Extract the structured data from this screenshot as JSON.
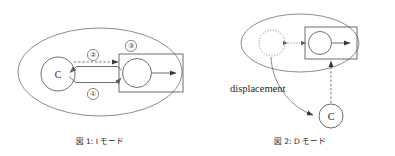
{
  "page": {
    "background_color": "#ffffff",
    "ink_color": "#1f1f1f",
    "width": 395,
    "height": 156
  },
  "figures": [
    {
      "id": "figure-1",
      "caption": "図 1: I モード",
      "caption_number": "図 1:",
      "caption_title": "I モード",
      "outer_shape": "ellipse",
      "nodes": [
        {
          "name": "controller-circle",
          "label": "C",
          "shape": "circle",
          "style": "solid"
        },
        {
          "name": "plant-circle",
          "label": "",
          "shape": "circle",
          "style": "solid"
        },
        {
          "name": "plant-box",
          "label": "",
          "shape": "rectangle",
          "style": "solid"
        }
      ],
      "edge_labels": [
        "①",
        "②",
        "③"
      ],
      "edges": [
        {
          "name": "edge-2-dashed",
          "label": "②",
          "style": "dashed",
          "direction": "right"
        },
        {
          "name": "edge-feedback",
          "label": "",
          "style": "solid",
          "direction": "left"
        },
        {
          "name": "edge-1-solid",
          "label": "①",
          "style": "solid",
          "direction": "right"
        },
        {
          "name": "edge-output",
          "label": "",
          "style": "solid",
          "direction": "right"
        }
      ],
      "region_label": "③"
    },
    {
      "id": "figure-2",
      "caption": "図 2: D モード",
      "caption_number": "図 2:",
      "caption_title": "D モード",
      "outer_shape": "ellipse",
      "annotation": "displacement",
      "nodes": [
        {
          "name": "vacated-circle",
          "label": "",
          "shape": "circle",
          "style": "dotted"
        },
        {
          "name": "plant-circle",
          "label": "",
          "shape": "circle",
          "style": "solid"
        },
        {
          "name": "plant-box",
          "label": "",
          "shape": "rectangle",
          "style": "solid"
        },
        {
          "name": "controller-circle",
          "label": "C",
          "shape": "circle",
          "style": "solid"
        }
      ],
      "edges": [
        {
          "name": "edge-bidirectional-dotted",
          "label": "",
          "style": "dotted",
          "direction": "both"
        },
        {
          "name": "edge-output",
          "label": "",
          "style": "solid",
          "direction": "right"
        },
        {
          "name": "edge-displacement-curve",
          "label": "displacement",
          "style": "solid",
          "direction": "down-right"
        },
        {
          "name": "edge-link-dashed",
          "label": "",
          "style": "dashed",
          "direction": "up"
        }
      ]
    }
  ]
}
